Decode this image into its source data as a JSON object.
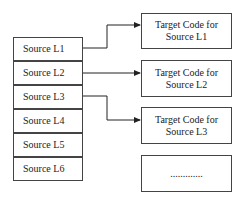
{
  "sources": [
    {
      "label": "Source L1"
    },
    {
      "label": "Source L2"
    },
    {
      "label": "Source L3"
    },
    {
      "label": "Source L4"
    },
    {
      "label": "Source L5"
    },
    {
      "label": "Source L6"
    }
  ],
  "targets": [
    {
      "label": "Target Code for\nSource L1"
    },
    {
      "label": "Target Code for\nSource L2"
    },
    {
      "label": "Target Code for\nSource L3"
    },
    {
      "label": "............."
    }
  ]
}
